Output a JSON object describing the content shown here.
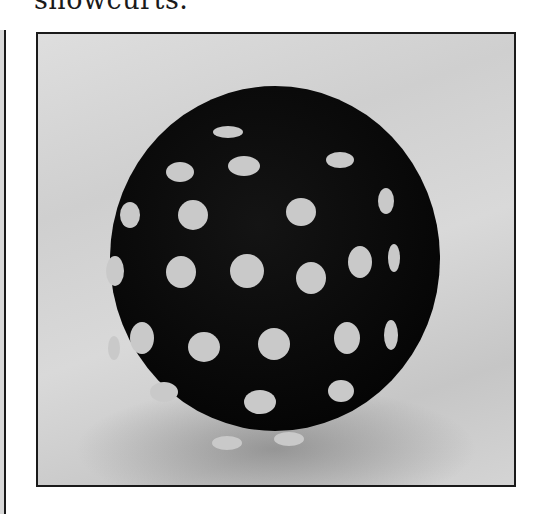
{
  "page": {
    "top_text_fragment": "showcurts.",
    "bottom_text_fragment": ""
  },
  "figure": {
    "colors": {
      "ball": "#0a0a0a",
      "spots": "#c9c9c9",
      "background": "#d4d4d4",
      "frame": "#1a1a1a"
    },
    "holes": [
      {
        "x": 175,
        "y": 62,
        "w": 30,
        "h": 12
      },
      {
        "x": 128,
        "y": 98,
        "w": 28,
        "h": 20
      },
      {
        "x": 190,
        "y": 92,
        "w": 32,
        "h": 20
      },
      {
        "x": 288,
        "y": 88,
        "w": 28,
        "h": 16
      },
      {
        "x": 82,
        "y": 138,
        "w": 20,
        "h": 26
      },
      {
        "x": 140,
        "y": 136,
        "w": 30,
        "h": 30
      },
      {
        "x": 248,
        "y": 134,
        "w": 30,
        "h": 28
      },
      {
        "x": 340,
        "y": 124,
        "w": 16,
        "h": 26
      },
      {
        "x": 68,
        "y": 192,
        "w": 18,
        "h": 30
      },
      {
        "x": 128,
        "y": 192,
        "w": 30,
        "h": 32
      },
      {
        "x": 192,
        "y": 190,
        "w": 34,
        "h": 34
      },
      {
        "x": 258,
        "y": 198,
        "w": 30,
        "h": 32
      },
      {
        "x": 310,
        "y": 182,
        "w": 24,
        "h": 32
      },
      {
        "x": 350,
        "y": 180,
        "w": 12,
        "h": 28
      },
      {
        "x": 92,
        "y": 258,
        "w": 24,
        "h": 32
      },
      {
        "x": 150,
        "y": 268,
        "w": 32,
        "h": 30
      },
      {
        "x": 220,
        "y": 264,
        "w": 32,
        "h": 32
      },
      {
        "x": 296,
        "y": 258,
        "w": 26,
        "h": 32
      },
      {
        "x": 346,
        "y": 256,
        "w": 14,
        "h": 30
      },
      {
        "x": 70,
        "y": 272,
        "w": 12,
        "h": 24
      },
      {
        "x": 112,
        "y": 318,
        "w": 28,
        "h": 20
      },
      {
        "x": 206,
        "y": 326,
        "w": 32,
        "h": 24
      },
      {
        "x": 290,
        "y": 316,
        "w": 26,
        "h": 22
      },
      {
        "x": 174,
        "y": 372,
        "w": 30,
        "h": 14
      },
      {
        "x": 236,
        "y": 368,
        "w": 30,
        "h": 14
      }
    ]
  }
}
